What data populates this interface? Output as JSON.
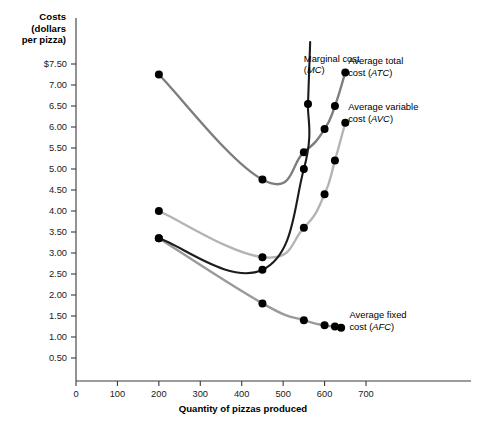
{
  "chart_data": {
    "type": "line",
    "title": "",
    "ylabel": "Costs (dollars per pizza)",
    "ylabel_lines": [
      "Costs",
      "(dollars",
      "per pizza)"
    ],
    "xlabel": "Quantity of pizzas produced",
    "xlim": [
      0,
      700
    ],
    "ylim": [
      0,
      7.75
    ],
    "grid": false,
    "legend_position": "inline-annotations",
    "xticks": [
      0,
      100,
      200,
      300,
      400,
      500,
      600,
      700
    ],
    "xtick_labels": [
      "0",
      "100",
      "200",
      "300",
      "400",
      "500",
      "600",
      "700"
    ],
    "yticks": [
      0.5,
      1.0,
      1.5,
      2.0,
      2.5,
      3.0,
      3.5,
      4.0,
      4.5,
      5.0,
      5.5,
      6.0,
      6.5,
      7.0,
      7.5
    ],
    "ytick_labels": [
      "0.50",
      "1.00",
      "1.50",
      "2.00",
      "2.50",
      "3.00",
      "3.50",
      "4.00",
      "4.50",
      "5.00",
      "5.50",
      "6.00",
      "6.50",
      "7.00",
      "$7.50"
    ],
    "series": [
      {
        "name": "Marginal cost (MC)",
        "short": "MC",
        "color": "#1c1c1c",
        "width": 2.1,
        "label_lines": [
          "Marginal cost",
          "(MC)"
        ],
        "label_x": 550,
        "label_y": 7.55,
        "points": [
          {
            "x": 200,
            "y": 3.35
          },
          {
            "x": 450,
            "y": 2.6
          },
          {
            "x": 550,
            "y": 5.0
          },
          {
            "x": 560,
            "y": 6.55
          }
        ],
        "clipped_top": true
      },
      {
        "name": "Average total cost (ATC)",
        "short": "ATC",
        "color": "#7d7d7d",
        "width": 2.4,
        "label_lines": [
          "Average total",
          "cost (ATC)"
        ],
        "label_x": 657,
        "label_y": 7.5,
        "points": [
          {
            "x": 200,
            "y": 7.25
          },
          {
            "x": 450,
            "y": 4.75
          },
          {
            "x": 550,
            "y": 5.4
          },
          {
            "x": 600,
            "y": 5.95
          },
          {
            "x": 625,
            "y": 6.5
          },
          {
            "x": 650,
            "y": 7.3
          }
        ]
      },
      {
        "name": "Average variable cost (AVC)",
        "short": "AVC",
        "color": "#b4b4b4",
        "width": 2.4,
        "label_lines": [
          "Average variable",
          "cost (AVC)"
        ],
        "label_x": 657,
        "label_y": 6.4,
        "points": [
          {
            "x": 200,
            "y": 4.0
          },
          {
            "x": 450,
            "y": 2.9
          },
          {
            "x": 550,
            "y": 3.6
          },
          {
            "x": 600,
            "y": 4.4
          },
          {
            "x": 625,
            "y": 5.2
          },
          {
            "x": 650,
            "y": 6.1
          }
        ]
      },
      {
        "name": "Average fixed cost (AFC)",
        "short": "AFC",
        "color": "#9a9a9a",
        "width": 2.4,
        "label_lines": [
          "Average fixed",
          "cost (AFC)"
        ],
        "label_x": 660,
        "label_y": 1.45,
        "points": [
          {
            "x": 200,
            "y": 3.35
          },
          {
            "x": 450,
            "y": 1.8
          },
          {
            "x": 550,
            "y": 1.4
          },
          {
            "x": 600,
            "y": 1.28
          },
          {
            "x": 625,
            "y": 1.25
          },
          {
            "x": 640,
            "y": 1.22
          }
        ]
      }
    ]
  }
}
